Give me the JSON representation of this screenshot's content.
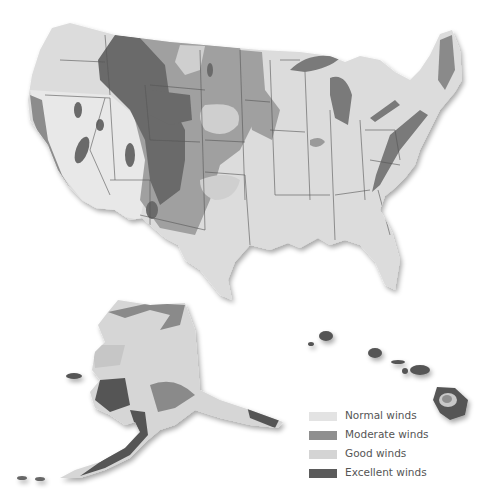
{
  "map": {
    "title": "US wind resource map",
    "regions": [
      "Contiguous United States",
      "Alaska",
      "Hawaii"
    ]
  },
  "legend": {
    "items": [
      {
        "label": "Normal winds",
        "color": "#e3e3e3"
      },
      {
        "label": "Moderate winds",
        "color": "#8f8f8f"
      },
      {
        "label": "Good winds",
        "color": "#d4d4d4"
      },
      {
        "label": "Excellent winds",
        "color": "#5b5b5b"
      }
    ]
  },
  "colors": {
    "land": "#dcdcdc",
    "moderate": "#a3a3a3",
    "good": "#c9c9c9",
    "excellent": "#6d6d6d",
    "border": "#555555"
  }
}
